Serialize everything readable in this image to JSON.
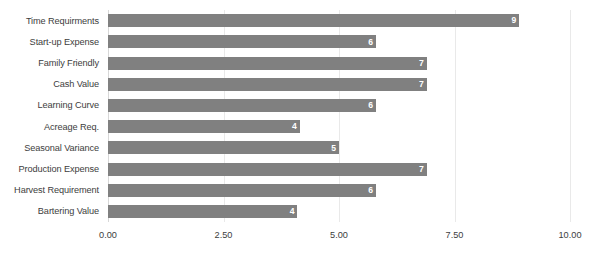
{
  "chart_data": {
    "type": "bar",
    "orientation": "horizontal",
    "title": "",
    "subtitle": "",
    "xlabel": "",
    "ylabel": "",
    "xlim": [
      0,
      10
    ],
    "grid": true,
    "legend": false,
    "legend_position": "none",
    "bar_color": "#808080",
    "gridline_color": "#e9e9e9",
    "label_color": "#3d3d3d",
    "value_label_color": "#ffffff",
    "x_ticks": [
      "0.00",
      "2.50",
      "5.00",
      "7.50",
      "10.00"
    ],
    "x_tick_values": [
      0,
      2.5,
      5,
      7.5,
      10
    ],
    "categories": [
      "Time Requirments",
      "Start-up Expense",
      "Family Friendly",
      "Cash Value",
      "Learning Curve",
      "Acreage Req.",
      "Seasonal Variance",
      "Production Expense",
      "Harvest Requirement",
      "Bartering Value"
    ],
    "values": [
      9,
      6,
      7,
      7,
      6,
      4,
      5,
      7,
      6,
      4
    ],
    "value_labels": [
      "9",
      "6",
      "7",
      "7",
      "6",
      "4",
      "5",
      "7",
      "6",
      "4"
    ],
    "bars": [
      {
        "category": "Time Requirments",
        "value": 8.9,
        "label": "9"
      },
      {
        "category": "Start-up Expense",
        "value": 5.8,
        "label": "6"
      },
      {
        "category": "Family Friendly",
        "value": 6.9,
        "label": "7"
      },
      {
        "category": "Cash Value",
        "value": 6.9,
        "label": "7"
      },
      {
        "category": "Learning Curve",
        "value": 5.8,
        "label": "6"
      },
      {
        "category": "Acreage Req.",
        "value": 4.15,
        "label": "4"
      },
      {
        "category": "Seasonal Variance",
        "value": 5.0,
        "label": "5"
      },
      {
        "category": "Production Expense",
        "value": 6.9,
        "label": "7"
      },
      {
        "category": "Harvest Requirement",
        "value": 5.8,
        "label": "6"
      },
      {
        "category": "Bartering Value",
        "value": 4.1,
        "label": "4"
      }
    ]
  }
}
